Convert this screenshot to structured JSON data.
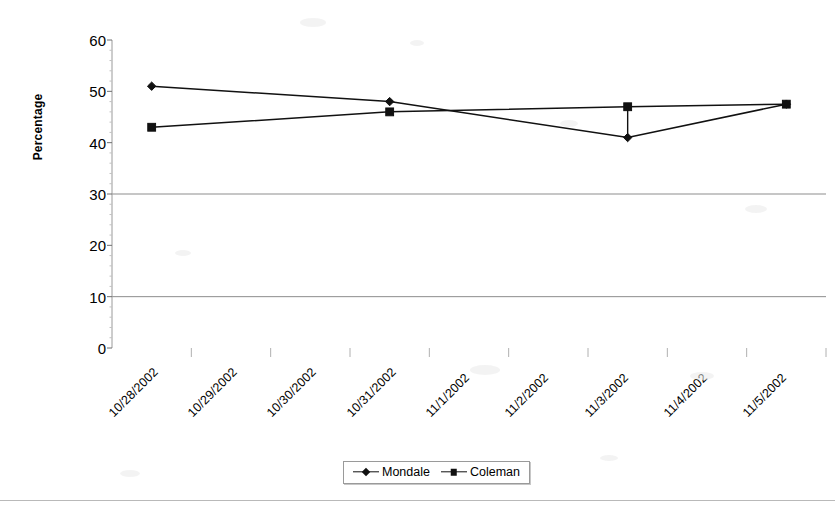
{
  "chart_data": {
    "type": "line",
    "title": "",
    "xlabel": "",
    "ylabel": "Percentage",
    "ylim": [
      0,
      60
    ],
    "ytick_step": 10,
    "yticks": [
      "0",
      "10",
      "20",
      "30",
      "40",
      "50",
      "60"
    ],
    "gridlines_at": [
      10,
      30
    ],
    "grid": "horizontal-partial",
    "legend_position": "bottom-center",
    "categories": [
      "10/28/2002",
      "10/29/2002",
      "10/30/2002",
      "10/31/2002",
      "11/1/2002",
      "11/2/2002",
      "11/3/2002",
      "11/4/2002",
      "11/5/2002"
    ],
    "series": [
      {
        "name": "Mondale",
        "marker": "diamond",
        "color": "#111111",
        "values": [
          51,
          null,
          null,
          48,
          null,
          null,
          41,
          null,
          47.5
        ]
      },
      {
        "name": "Coleman",
        "marker": "square",
        "color": "#111111",
        "values": [
          43,
          null,
          null,
          46,
          null,
          null,
          47,
          null,
          47.5
        ]
      }
    ]
  },
  "legend": {
    "entries": [
      {
        "label": "Mondale",
        "marker": "diamond"
      },
      {
        "label": "Coleman",
        "marker": "square"
      }
    ]
  }
}
